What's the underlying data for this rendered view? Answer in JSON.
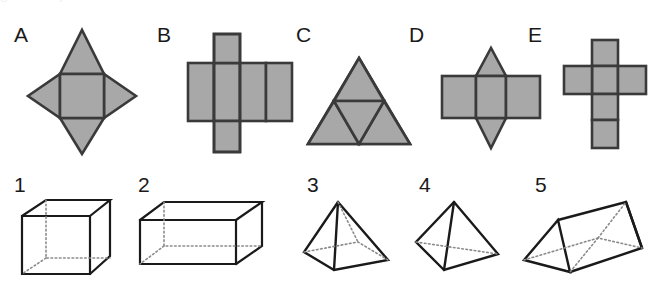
{
  "page": {
    "background_color": "#ffffff",
    "net_fill_color": "#a8a8a8",
    "net_stroke_color": "#3a3a3a",
    "solid_stroke_color": "#1a1a1a",
    "label_color": "#1a1a1a",
    "clipped_header_text": "geometry nets and solids"
  },
  "nets": [
    {
      "label": "A",
      "name": "square-pyramid-net",
      "description": "central square with four triangular flaps, one on each side",
      "label_x": 14,
      "label_y": 24,
      "fig_x": 26,
      "fig_y": 28,
      "fig_w": 112,
      "fig_h": 128
    },
    {
      "label": "B",
      "name": "cube-net-row-of-four",
      "description": "horizontal row of four squares with one square above and one square below the second square",
      "label_x": 157,
      "label_y": 24,
      "fig_x": 186,
      "fig_y": 32,
      "fig_w": 108,
      "fig_h": 122
    },
    {
      "label": "C",
      "name": "tetrahedron-net",
      "description": "large equilateral triangle subdivided into four smaller equilateral triangles",
      "label_x": 296,
      "label_y": 24,
      "fig_x": 306,
      "fig_y": 56,
      "fig_w": 106,
      "fig_h": 90
    },
    {
      "label": "D",
      "name": "triangular-prism-net",
      "description": "row of three rectangles with a triangle above and a triangle below the middle rectangle",
      "label_x": 409,
      "label_y": 24,
      "fig_x": 440,
      "fig_y": 46,
      "fig_w": 102,
      "fig_h": 104
    },
    {
      "label": "E",
      "name": "cube-net-cross",
      "description": "vertical column of four squares with one square on each side of the second square forming a cross",
      "label_x": 528,
      "label_y": 24,
      "fig_x": 562,
      "fig_y": 38,
      "fig_w": 86,
      "fig_h": 112
    }
  ],
  "solids": [
    {
      "label": "1",
      "name": "cube",
      "description": "wireframe cube with dotted hidden edges",
      "label_x": 14,
      "label_y": 174,
      "fig_x": 18,
      "fig_y": 196,
      "fig_w": 96,
      "fig_h": 82
    },
    {
      "label": "2",
      "name": "rectangular-cuboid",
      "description": "wireframe rectangular prism wider than tall with dotted hidden edges",
      "label_x": 138,
      "label_y": 174,
      "fig_x": 136,
      "fig_y": 198,
      "fig_w": 130,
      "fig_h": 76
    },
    {
      "label": "3",
      "name": "square-based-pyramid",
      "description": "pyramid on a square base with dotted hidden edges",
      "label_x": 307,
      "label_y": 174,
      "fig_x": 300,
      "fig_y": 198,
      "fig_w": 96,
      "fig_h": 78
    },
    {
      "label": "4",
      "name": "tetrahedron",
      "description": "triangular pyramid with one dotted hidden edge",
      "label_x": 419,
      "label_y": 174,
      "fig_x": 410,
      "fig_y": 198,
      "fig_w": 94,
      "fig_h": 78
    },
    {
      "label": "5",
      "name": "triangular-prism",
      "description": "triangular prism lying on its side with dotted hidden edges",
      "label_x": 535,
      "label_y": 174,
      "fig_x": 520,
      "fig_y": 198,
      "fig_w": 126,
      "fig_h": 80
    }
  ]
}
